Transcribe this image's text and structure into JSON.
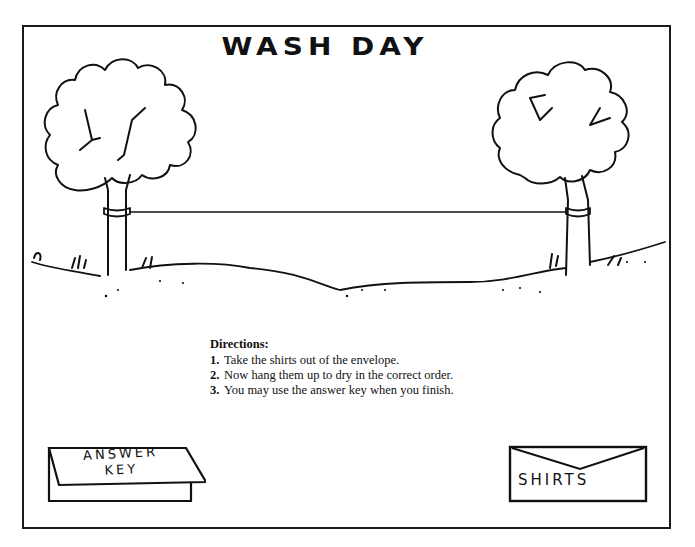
{
  "title": "WASH DAY",
  "directions": {
    "heading": "Directions:",
    "steps": [
      {
        "num": "1.",
        "text": "Take the shirts out of the envelope."
      },
      {
        "num": "2.",
        "text": "Now hang them up to dry in the correct order."
      },
      {
        "num": "3.",
        "text": "You may use the answer key when you finish."
      }
    ]
  },
  "answer_key": {
    "line1": "ANSWER",
    "line2": "KEY"
  },
  "envelope": {
    "label": "SHIRTS"
  },
  "scene": {
    "elements": [
      "left-tree",
      "right-tree",
      "clothesline",
      "ground"
    ],
    "line_color": "#111111",
    "background": "#ffffff"
  }
}
